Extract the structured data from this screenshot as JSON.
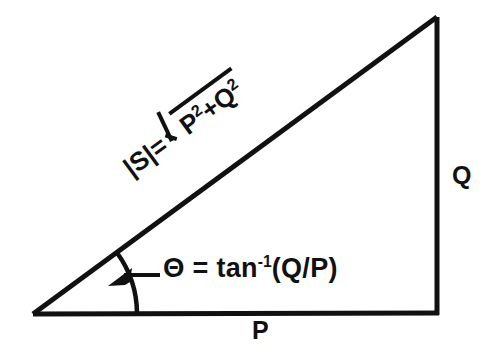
{
  "figure": {
    "kind": "power-triangle-diagram",
    "background_color": "#ffffff",
    "stroke_color": "#111111"
  },
  "triangle": {
    "name": "right-triangle",
    "vertices": {
      "origin": {
        "x": 33,
        "y": 314
      },
      "corner": {
        "x": 437,
        "y": 313
      },
      "apex": {
        "x": 437,
        "y": 17
      }
    },
    "stroke_width": 4,
    "right_angle_at": "corner"
  },
  "labels": {
    "base": "P",
    "vertical": "Q",
    "magnitude": {
      "lhs": "|S|=",
      "radicand_first": "P",
      "radicand_first_exp": "2",
      "operator": "+",
      "radicand_second": "Q",
      "radicand_second_exp": "2",
      "plain_text": "|S| = √(P²+Q²)",
      "rotation_deg": -36.3
    },
    "angle": {
      "symbol": "Θ",
      "equals": "=",
      "function": "tan",
      "exponent": "-1",
      "argument": "(Q/P)",
      "plain_text": "Θ = tan⁻¹(Q/P)"
    }
  },
  "angle_arc": {
    "name": "theta-arc",
    "center": {
      "x": 33,
      "y": 314
    },
    "radius": 104,
    "start_deg": -36.3,
    "end_deg": 0,
    "stroke_width": 4
  },
  "leader": {
    "name": "angle-leader-line",
    "from": {
      "x": 158,
      "y": 275
    },
    "to": {
      "x": 119,
      "y": 275
    },
    "arrowhead": "left",
    "stroke_width": 4
  }
}
